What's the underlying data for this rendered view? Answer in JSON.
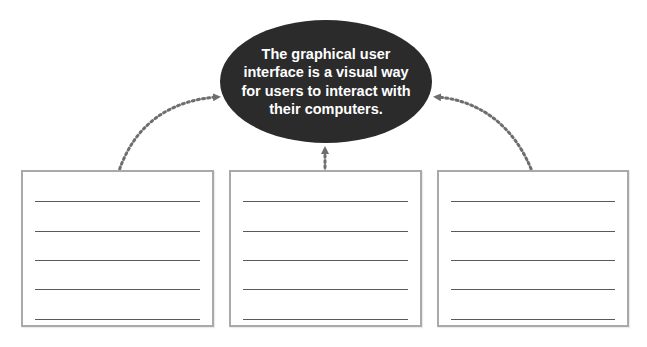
{
  "diagram": {
    "type": "concept-map",
    "central_node": {
      "text": "The graphical user interface is a visual way for users to interact with their computers.",
      "lines": [
        "The graphical user",
        "interface is a visual way",
        "for users to interact with",
        "their computers."
      ],
      "fill": "#2b2b2c",
      "text_color": "#ffffff"
    },
    "boxes": [
      {
        "id": "box-left",
        "blank_lines": 5
      },
      {
        "id": "box-middle",
        "blank_lines": 5
      },
      {
        "id": "box-right",
        "blank_lines": 5
      }
    ],
    "connectors": [
      {
        "from": "box-left",
        "to": "central_node",
        "style": "dotted-curved-arrow"
      },
      {
        "from": "box-middle",
        "to": "central_node",
        "style": "dotted-straight-arrow"
      },
      {
        "from": "box-right",
        "to": "central_node",
        "style": "dotted-curved-arrow"
      }
    ],
    "colors": {
      "connector": "#6e6e6e",
      "box_border": "#a9a9a9",
      "writing_line": "#5a5a5a"
    }
  }
}
